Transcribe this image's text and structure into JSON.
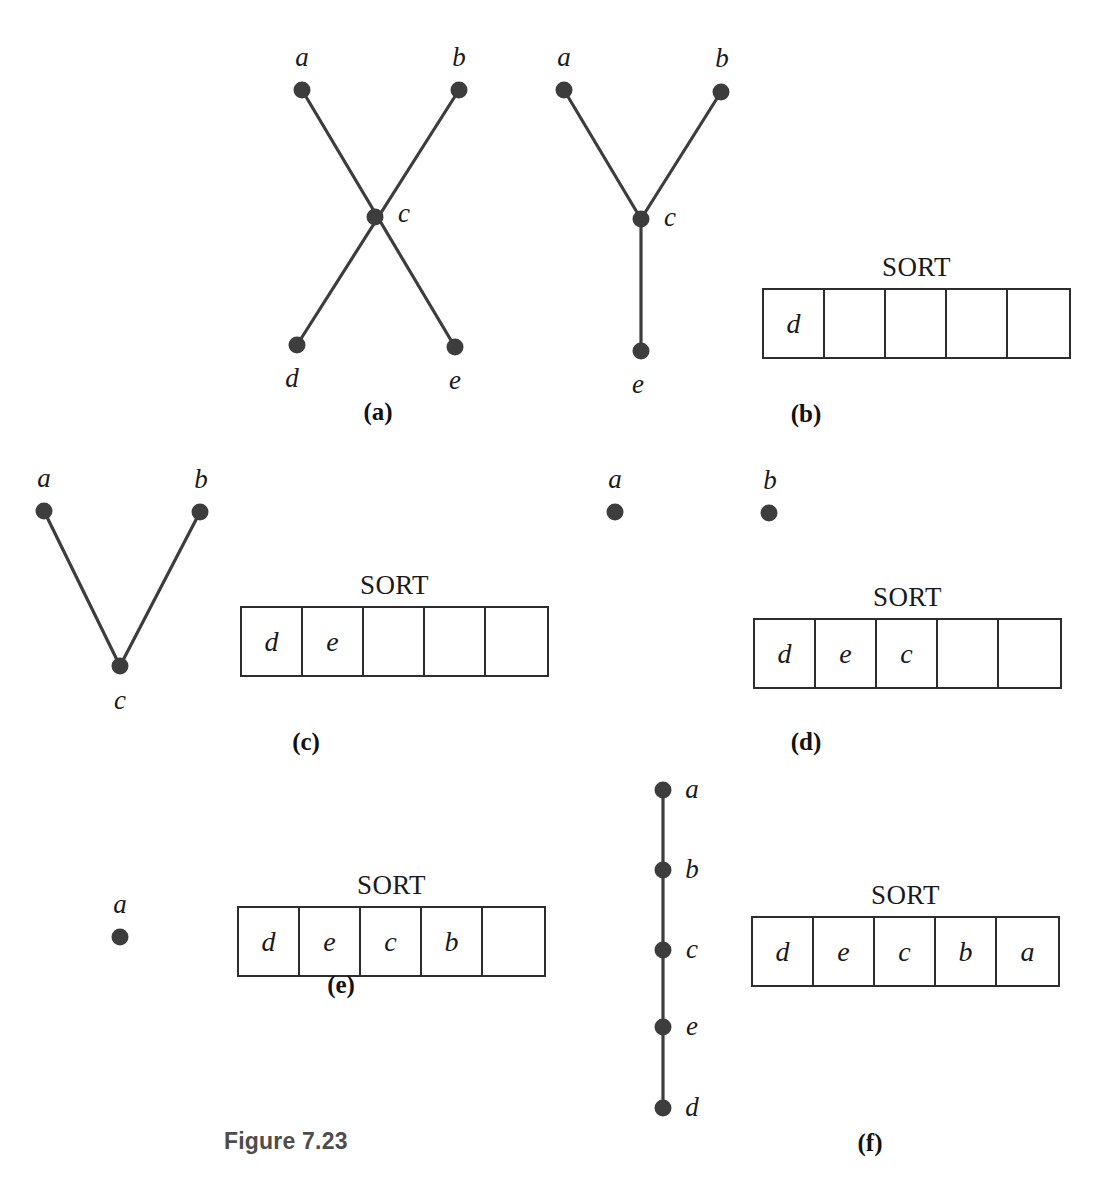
{
  "figure": {
    "caption": "Figure 7.23",
    "background_color": "#ffffff",
    "node_color": "#3d3d3d",
    "line_color": "#3d3d3d",
    "text_color": "#1a1a1a"
  },
  "sort_label": "SORT",
  "panels": [
    {
      "id": "a",
      "caption": "(a)",
      "nodes": [
        {
          "name": "a",
          "x": 302,
          "y": 90,
          "label_x": 302,
          "label_y": 57
        },
        {
          "name": "b",
          "x": 459,
          "y": 90,
          "label_x": 459,
          "label_y": 57
        },
        {
          "name": "c",
          "x": 375,
          "y": 217,
          "label_x": 404,
          "label_y": 213
        },
        {
          "name": "d",
          "x": 297,
          "y": 345,
          "label_x": 292,
          "label_y": 378
        },
        {
          "name": "e",
          "x": 455,
          "y": 347,
          "label_x": 455,
          "label_y": 380
        }
      ],
      "edges": [
        [
          "a",
          "e"
        ],
        [
          "b",
          "d"
        ]
      ],
      "sort": null
    },
    {
      "id": "b",
      "caption": "(b)",
      "nodes": [
        {
          "name": "a",
          "x": 564,
          "y": 90,
          "label_x": 564,
          "label_y": 57
        },
        {
          "name": "b",
          "x": 721,
          "y": 92,
          "label_x": 722,
          "label_y": 58
        },
        {
          "name": "c",
          "x": 641,
          "y": 219,
          "label_x": 670,
          "label_y": 217
        },
        {
          "name": "e",
          "x": 641,
          "y": 351,
          "label_x": 638,
          "label_y": 384
        }
      ],
      "edges": [
        [
          "a",
          "c"
        ],
        [
          "b",
          "c"
        ],
        [
          "c",
          "e"
        ]
      ],
      "sort": {
        "cells": [
          "d",
          "",
          "",
          "",
          ""
        ],
        "x": 762,
        "y": 290
      }
    },
    {
      "id": "c",
      "caption": "(c)",
      "nodes": [
        {
          "name": "a",
          "x": 44,
          "y": 511,
          "label_x": 44,
          "label_y": 478
        },
        {
          "name": "b",
          "x": 200,
          "y": 512,
          "label_x": 201,
          "label_y": 479
        },
        {
          "name": "c",
          "x": 120,
          "y": 666,
          "label_x": 120,
          "label_y": 700
        }
      ],
      "edges": [
        [
          "a",
          "c"
        ],
        [
          "b",
          "c"
        ]
      ],
      "sort": {
        "cells": [
          "d",
          "e",
          "",
          "",
          ""
        ],
        "x": 240,
        "y": 608
      }
    },
    {
      "id": "d",
      "caption": "(d)",
      "nodes": [
        {
          "name": "a",
          "x": 615,
          "y": 512,
          "label_x": 615,
          "label_y": 479
        },
        {
          "name": "b",
          "x": 769,
          "y": 513,
          "label_x": 770,
          "label_y": 480
        }
      ],
      "edges": [],
      "sort": {
        "cells": [
          "d",
          "e",
          "c",
          "",
          ""
        ],
        "x": 753,
        "y": 620
      }
    },
    {
      "id": "e",
      "caption": "(e)",
      "nodes": [
        {
          "name": "a",
          "x": 120,
          "y": 937,
          "label_x": 120,
          "label_y": 904
        }
      ],
      "edges": [],
      "sort": {
        "cells": [
          "d",
          "e",
          "c",
          "b",
          ""
        ],
        "x": 237,
        "y": 908
      }
    },
    {
      "id": "f",
      "caption": "(f)",
      "nodes": [
        {
          "name": "a",
          "x": 663,
          "y": 790,
          "label_x": 692,
          "label_y": 789
        },
        {
          "name": "b",
          "x": 663,
          "y": 870,
          "label_x": 692,
          "label_y": 869
        },
        {
          "name": "c",
          "x": 663,
          "y": 950,
          "label_x": 692,
          "label_y": 949
        },
        {
          "name": "e",
          "x": 663,
          "y": 1027,
          "label_x": 692,
          "label_y": 1026
        },
        {
          "name": "d",
          "x": 663,
          "y": 1108,
          "label_x": 692,
          "label_y": 1107
        }
      ],
      "edges": [
        [
          "a",
          "b"
        ],
        [
          "b",
          "c"
        ],
        [
          "c",
          "e"
        ],
        [
          "e",
          "d"
        ]
      ],
      "sort": {
        "cells": [
          "d",
          "e",
          "c",
          "b",
          "a"
        ],
        "x": 751,
        "y": 918
      }
    }
  ],
  "captions": [
    {
      "id": "a",
      "text": "(a)",
      "x": 378,
      "y": 398
    },
    {
      "id": "b",
      "text": "(b)",
      "x": 806,
      "y": 400
    },
    {
      "id": "c",
      "text": "(c)",
      "x": 306,
      "y": 728
    },
    {
      "id": "d",
      "text": "(d)",
      "x": 806,
      "y": 728
    },
    {
      "id": "e",
      "text": "(e)",
      "x": 341,
      "y": 971
    },
    {
      "id": "f",
      "text": "(f)",
      "x": 870,
      "y": 1129
    }
  ],
  "figure_caption_position": {
    "x": 224,
    "y": 1128
  }
}
